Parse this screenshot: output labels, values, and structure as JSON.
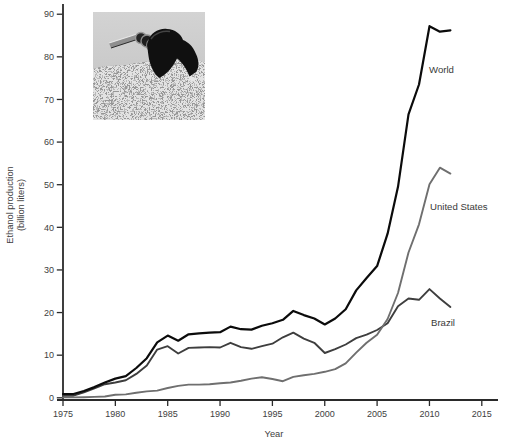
{
  "chart_data": {
    "type": "line",
    "title": "",
    "xlabel": "Year",
    "ylabel": "Ethanol production (billion liters)",
    "ylabel_lines": [
      "Ethanol production",
      "(billion liters)"
    ],
    "xlim": [
      1975,
      2016.6
    ],
    "ylim": [
      0,
      90
    ],
    "x_ticks": [
      1975,
      1980,
      1985,
      1990,
      1995,
      2000,
      2005,
      2010,
      2015
    ],
    "y_ticks": [
      0,
      10,
      20,
      30,
      40,
      50,
      60,
      70,
      80,
      90
    ],
    "grid": false,
    "legend_position": "inline labels at right side of lines",
    "axis_color": "#2a2a2a",
    "tick_label_color": "#3e3e3e",
    "x": [
      1975,
      1976,
      1977,
      1978,
      1979,
      1980,
      1981,
      1982,
      1983,
      1984,
      1985,
      1986,
      1987,
      1988,
      1989,
      1990,
      1991,
      1992,
      1993,
      1994,
      1995,
      1996,
      1997,
      1998,
      1999,
      2000,
      2001,
      2002,
      2003,
      2004,
      2005,
      2006,
      2007,
      2008,
      2009,
      2010,
      2011,
      2012
    ],
    "series": [
      {
        "name": "World",
        "color": "#0b0b0b",
        "stroke_width": 2.2,
        "label": {
          "text": "World",
          "x": 429,
          "y": 73
        },
        "values": [
          0.9,
          0.9,
          1.6,
          2.5,
          3.6,
          4.5,
          5.1,
          7.0,
          9.3,
          13.0,
          14.6,
          13.4,
          14.9,
          15.1,
          15.3,
          15.4,
          16.7,
          16.1,
          16.0,
          16.9,
          17.5,
          18.3,
          20.4,
          19.4,
          18.6,
          17.2,
          18.6,
          20.8,
          25.2,
          28.1,
          30.9,
          38.5,
          49.5,
          66.5,
          73.5,
          87.2,
          85.9,
          86.2
        ]
      },
      {
        "name": "United States",
        "color": "#6f6f6f",
        "stroke_width": 1.9,
        "label": {
          "text": "United States",
          "x": 430,
          "y": 210
        },
        "values": [
          0.1,
          0.1,
          0.15,
          0.2,
          0.3,
          0.7,
          0.8,
          1.2,
          1.5,
          1.7,
          2.3,
          2.8,
          3.1,
          3.1,
          3.2,
          3.4,
          3.6,
          4.0,
          4.5,
          4.8,
          4.4,
          3.9,
          4.9,
          5.3,
          5.6,
          6.1,
          6.7,
          8.1,
          10.6,
          12.9,
          14.8,
          18.5,
          24.6,
          34.1,
          40.7,
          50.1,
          54.0,
          52.6
        ]
      },
      {
        "name": "Brazil",
        "color": "#3e3e3e",
        "stroke_width": 1.9,
        "label": {
          "text": "Brazil",
          "x": 431,
          "y": 326
        },
        "values": [
          0.5,
          0.5,
          1.3,
          2.2,
          3.2,
          3.6,
          4.1,
          5.6,
          7.6,
          11.3,
          12.1,
          10.4,
          11.7,
          11.8,
          11.9,
          11.8,
          12.9,
          11.9,
          11.5,
          12.1,
          12.7,
          14.2,
          15.3,
          13.9,
          12.9,
          10.5,
          11.4,
          12.5,
          14.0,
          14.8,
          15.9,
          17.5,
          21.5,
          23.3,
          23.0,
          25.5,
          23.3,
          21.3
        ]
      }
    ]
  },
  "inset_photo": {
    "alt": "Black gasoline-pump nozzle lying on gravel",
    "style": "grayscale photograph"
  }
}
